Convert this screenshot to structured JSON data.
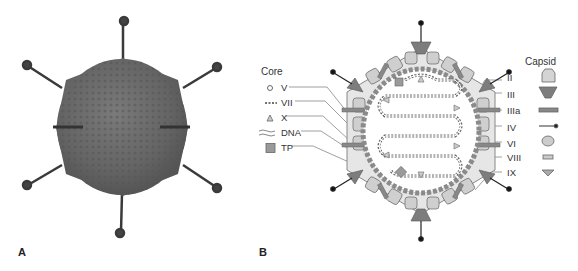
{
  "panels": {
    "a": {
      "label": "A"
    },
    "b": {
      "label": "B"
    }
  },
  "legend_core": {
    "title": "Core",
    "items": [
      {
        "label": "V",
        "icon": "circle-icon"
      },
      {
        "label": "VII",
        "icon": "dashed-line-icon"
      },
      {
        "label": "X",
        "icon": "triangle-icon"
      },
      {
        "label": "DNA",
        "icon": "wavy-lines-icon"
      },
      {
        "label": "TP",
        "icon": "square-icon"
      }
    ]
  },
  "legend_capsid": {
    "title": "Capsid",
    "items": [
      {
        "label": "II",
        "icon": "hexon-icon"
      },
      {
        "label": "III",
        "icon": "penton-base-icon"
      },
      {
        "label": "IIIa",
        "icon": "bar-icon"
      },
      {
        "label": "IV",
        "icon": "fiber-icon"
      },
      {
        "label": "VI",
        "icon": "oval-icon"
      },
      {
        "label": "VIII",
        "icon": "small-rect-icon"
      },
      {
        "label": "IX",
        "icon": "small-triangle-icon"
      }
    ]
  },
  "colors": {
    "virion": "#6b6b6b",
    "hexon": "#cfcfcf",
    "penton": "#7d7d7d",
    "core_dots": "#8a8a8a",
    "outline": "#555555"
  }
}
